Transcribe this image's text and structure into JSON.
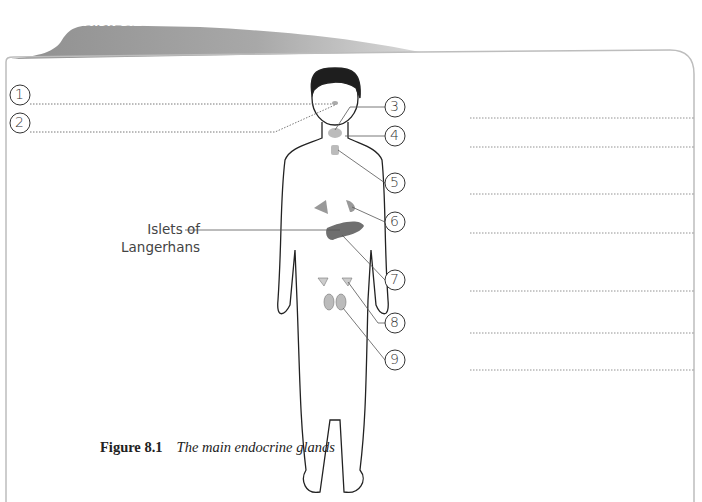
{
  "header": {
    "tab_label": "Task 8.1"
  },
  "labels": [
    {
      "number": "1"
    },
    {
      "number": "2"
    },
    {
      "number": "3"
    },
    {
      "number": "4"
    },
    {
      "number": "5"
    },
    {
      "number": "6"
    },
    {
      "number": "7"
    },
    {
      "number": "8"
    },
    {
      "number": "9"
    }
  ],
  "annotation": {
    "islets_line1": "Islets of",
    "islets_line2": "Langerhans"
  },
  "caption": {
    "figure_number": "Figure 8.1",
    "title": "The main endocrine glands"
  },
  "colors": {
    "tab": "#9a9a9a",
    "frame": "#bdbdbd",
    "gland": "#9e9e9e",
    "pancreas": "#6f6f6f"
  }
}
